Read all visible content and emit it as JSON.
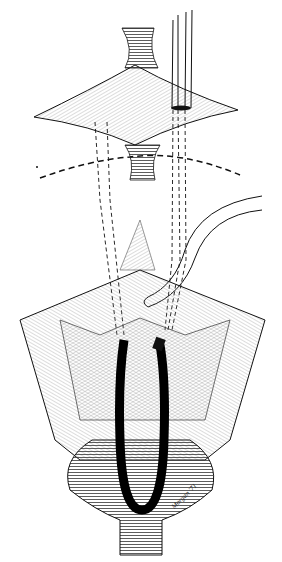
{
  "figure": {
    "signature": "Morgan '71",
    "colors": {
      "ink": "#111111",
      "background": "#ffffff",
      "hatch": "#555555"
    }
  }
}
